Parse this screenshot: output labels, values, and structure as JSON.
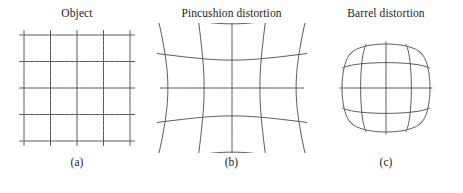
{
  "figure": {
    "background_color": "#ffffff",
    "line_color": "#585858",
    "text_color": "#1b1b1b",
    "panels": [
      {
        "id": "object",
        "title": "Object",
        "caption": "(a)",
        "distortion_type": "none",
        "distortion_k": 0.0,
        "grid_lines": 5
      },
      {
        "id": "pincushion",
        "title": "Pincushion distortion",
        "caption": "(b)",
        "distortion_type": "pincushion",
        "distortion_k": 0.42,
        "grid_lines": 5
      },
      {
        "id": "barrel",
        "title": "Barrel distortion",
        "caption": "(c)",
        "distortion_type": "barrel",
        "distortion_k": -0.34,
        "grid_lines": 5
      }
    ]
  },
  "chart_data": {
    "type": "line",
    "subtitle": "",
    "xlabel": "",
    "ylabel": "",
    "grid": true,
    "legend": "none",
    "series": [
      {
        "name": "Object",
        "label": "(a)",
        "distortion": "none",
        "k": 0.0,
        "node_rows": 5,
        "node_cols": 5,
        "normalized_nodes_x": [
          -1,
          -0.5,
          0,
          0.5,
          1
        ],
        "normalized_nodes_y": [
          -1,
          -0.5,
          0,
          0.5,
          1
        ]
      },
      {
        "name": "Pincushion distortion",
        "label": "(b)",
        "distortion": "pincushion",
        "k": 0.42,
        "node_rows": 5,
        "node_cols": 5,
        "normalized_nodes_x": [
          -1,
          -0.5,
          0,
          0.5,
          1
        ],
        "normalized_nodes_y": [
          -1,
          -0.5,
          0,
          0.5,
          1
        ]
      },
      {
        "name": "Barrel distortion",
        "label": "(c)",
        "distortion": "barrel",
        "k": -0.34,
        "node_rows": 5,
        "node_cols": 5,
        "normalized_nodes_x": [
          -1,
          -0.5,
          0,
          0.5,
          1
        ],
        "normalized_nodes_y": [
          -1,
          -0.5,
          0,
          0.5,
          1
        ]
      }
    ]
  }
}
